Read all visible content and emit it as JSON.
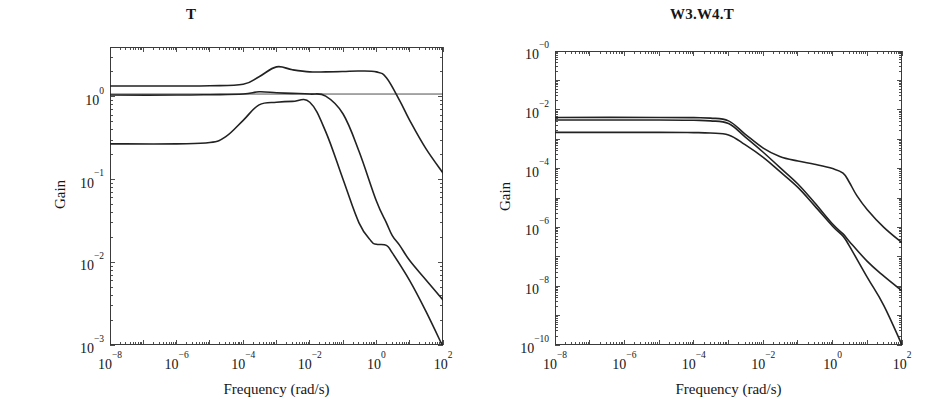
{
  "figure": {
    "background": "#ffffff",
    "line_color": "#222222",
    "axis_color": "#3b3b3b"
  },
  "panels": [
    {
      "id": "left",
      "title": "T",
      "xlabel": "Frequency (rad/s)",
      "ylabel": "Gain",
      "xticks": [
        "10-8",
        "10-6",
        "10-4",
        "10-2",
        "100",
        "102"
      ],
      "yticks": [
        "100",
        "10-1",
        "10-2",
        "10-3"
      ]
    },
    {
      "id": "right",
      "title": "W3.W4.T",
      "xlabel": "Frequency (rad/s)",
      "ylabel": "Gain",
      "xticks": [
        "10-8",
        "10-6",
        "10-4",
        "10-2",
        "100",
        "102"
      ],
      "yticks": [
        "10-0",
        "10-2",
        "10-4",
        "10-6",
        "10-8",
        "10-10"
      ]
    }
  ],
  "chart_data": [
    {
      "type": "line",
      "panel": "left",
      "title": "T",
      "xlabel": "Frequency (rad/s)",
      "ylabel": "Gain",
      "xscale": "log",
      "yscale": "log",
      "xlim": [
        1e-08,
        100
      ],
      "ylim": [
        0.001,
        4.0
      ],
      "xtick_values": [
        1e-08,
        1e-06,
        0.0001,
        0.01,
        1,
        100
      ],
      "xtick_labels": [
        "10^-8",
        "10^-6",
        "10^-4",
        "10^-2",
        "10^0",
        "10^2"
      ],
      "ytick_values": [
        1,
        0.1,
        0.01,
        0.001
      ],
      "ytick_labels": [
        "10^0",
        "10^-1",
        "10^-2",
        "10^-3"
      ],
      "grid": false,
      "legend": "none",
      "series": [
        {
          "name": "curve-upper",
          "comment": "starts 1.35, peaks 2.3 near 1e-3, plateau ~2.0, rolls off after 1, ends 0.12",
          "x": [
            1e-08,
            1e-06,
            1e-05,
            0.0001,
            0.0003,
            0.001,
            0.003,
            0.01,
            0.03,
            0.1,
            0.3,
            1,
            2,
            5,
            10,
            30,
            100
          ],
          "y": [
            1.35,
            1.35,
            1.36,
            1.42,
            1.75,
            2.3,
            2.12,
            2.0,
            2.0,
            2.02,
            2.05,
            2.0,
            1.7,
            0.9,
            0.52,
            0.24,
            0.12
          ]
        },
        {
          "name": "curve-middle",
          "comment": "starts 1.05, mild bump to 1.15 near 3e-4, knee at 0.03, steep decay, kink near 2, ends 0.0035",
          "x": [
            1e-08,
            1e-06,
            1e-05,
            0.0001,
            0.0003,
            0.001,
            0.003,
            0.01,
            0.03,
            0.1,
            0.3,
            1,
            2,
            3,
            5,
            10,
            30,
            100
          ],
          "y": [
            1.05,
            1.05,
            1.06,
            1.08,
            1.15,
            1.12,
            1.1,
            1.08,
            1.02,
            0.62,
            0.22,
            0.055,
            0.03,
            0.021,
            0.016,
            0.0105,
            0.0062,
            0.0035
          ]
        },
        {
          "name": "curve-lower",
          "comment": "starts 0.27, rises to 0.85 near 1e-3, shelf, decays from 1e-2, flattens ~0.016 near 1, falls to 0.001 at 100",
          "x": [
            1e-08,
            1e-06,
            1e-05,
            3e-05,
            0.0001,
            0.0003,
            0.001,
            0.003,
            0.01,
            0.03,
            0.1,
            0.3,
            0.7,
            1,
            2,
            3,
            10,
            30,
            100
          ],
          "y": [
            0.27,
            0.27,
            0.28,
            0.33,
            0.52,
            0.8,
            0.86,
            0.88,
            0.86,
            0.38,
            0.1,
            0.03,
            0.018,
            0.0165,
            0.016,
            0.013,
            0.006,
            0.0026,
            0.00095
          ]
        }
      ],
      "annotations": [
        {
          "type": "hline",
          "y": 1.08,
          "comment": "thin horizontal reference line spanning full width near gain 1"
        }
      ]
    },
    {
      "type": "line",
      "panel": "right",
      "title": "W3.W4.T",
      "xlabel": "Frequency (rad/s)",
      "ylabel": "Gain",
      "xscale": "log",
      "yscale": "log",
      "xlim": [
        1e-08,
        100
      ],
      "ylim": [
        1e-10,
        1.0
      ],
      "xtick_values": [
        1e-08,
        1e-06,
        0.0001,
        0.01,
        1,
        100
      ],
      "xtick_labels": [
        "10^-8",
        "10^-6",
        "10^-4",
        "10^-2",
        "10^0",
        "10^2"
      ],
      "ytick_values": [
        1,
        0.01,
        0.0001,
        1e-06,
        1e-08,
        1e-10
      ],
      "ytick_labels": [
        "10^-0",
        "10^-2",
        "10^-4",
        "10^-6",
        "10^-8",
        "10^-10"
      ],
      "grid": false,
      "legend": "none",
      "series": [
        {
          "name": "curve-shelf",
          "comment": "flat 5.5e-3, breaks 1e-3, shelf near 2e-4 from 0.03 to 3, then steep to 3e-7",
          "x": [
            1e-08,
            1e-05,
            0.0001,
            0.0003,
            0.001,
            0.003,
            0.01,
            0.03,
            0.1,
            0.3,
            1,
            2,
            3,
            5,
            10,
            30,
            100
          ],
          "y": [
            0.0055,
            0.0055,
            0.0054,
            0.0052,
            0.0042,
            0.0015,
            0.0005,
            0.00026,
            0.00018,
            0.00014,
            0.0001,
            7e-05,
            3.5e-05,
            1.2e-05,
            4e-06,
            1e-06,
            3e-07
          ]
        },
        {
          "name": "curve-mid",
          "comment": "flat 4.5e-3, breaks 1e-3, steady slope, crosses near 2, ends 7e-9",
          "x": [
            1e-08,
            1e-05,
            0.0001,
            0.0003,
            0.001,
            0.003,
            0.01,
            0.03,
            0.1,
            0.3,
            1,
            2,
            3,
            10,
            30,
            100
          ],
          "y": [
            0.0045,
            0.0045,
            0.0044,
            0.0042,
            0.0034,
            0.0012,
            0.00036,
            0.00011,
            3e-05,
            7e-06,
            1.3e-06,
            6e-07,
            3.4e-07,
            7e-08,
            2.2e-08,
            7e-09
          ]
        },
        {
          "name": "curve-steep",
          "comment": "flat 1.7e-3, breaks 1e-3, parallel descent then steepens past 2, ends 1e-10",
          "x": [
            1e-08,
            1e-05,
            0.0001,
            0.0003,
            0.001,
            0.003,
            0.01,
            0.03,
            0.1,
            0.3,
            1,
            2,
            3,
            10,
            30,
            100
          ],
          "y": [
            0.0017,
            0.0017,
            0.00168,
            0.00162,
            0.0014,
            0.00065,
            0.00024,
            8e-05,
            2.3e-05,
            5.5e-06,
            1.1e-06,
            5e-07,
            2.4e-07,
            2e-08,
            2.2e-09,
            1e-10
          ]
        }
      ]
    }
  ]
}
